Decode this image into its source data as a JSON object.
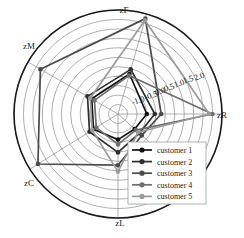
{
  "chart_data": {
    "type": "radar",
    "title": "",
    "xlabel": "",
    "ylabel": "",
    "grid": true,
    "legend_position": "bottom-right-inside",
    "categories": [
      "zR",
      "zF",
      "zM",
      "zC",
      "zL",
      "zX"
    ],
    "visible_axis_labels": [
      "zF",
      "zM",
      "zC",
      "zL",
      "zR"
    ],
    "rlim": [
      -1.25,
      2.0
    ],
    "rticks": [
      -1.0,
      -0.5,
      0.0,
      0.5,
      1.0,
      1.5,
      2.0
    ],
    "rtick_labels": [
      "-1.0",
      "-0.5",
      "0.0",
      "0.5",
      "1.0",
      "1.5",
      "2.0"
    ],
    "rtick_label_angle_deg": 20,
    "n_grid_rings": 11,
    "series": [
      {
        "name": "customer 1",
        "color": "#111111",
        "values": [
          -0.35,
          0.05,
          -0.3,
          -0.35,
          -0.45,
          -0.55
        ]
      },
      {
        "name": "customer 2",
        "color": "#2e2e2e",
        "values": [
          -0.1,
          0.2,
          -0.15,
          -0.2,
          -0.05,
          -0.35
        ]
      },
      {
        "name": "customer 3",
        "color": "#4a4a4a",
        "values": [
          0.1,
          1.85,
          1.55,
          1.7,
          0.35,
          -0.25
        ]
      },
      {
        "name": "customer 4",
        "color": "#6e6e6e",
        "values": [
          1.7,
          0.0,
          -0.4,
          -0.45,
          -0.3,
          -0.5
        ]
      },
      {
        "name": "customer 5",
        "color": "#9a9a9a",
        "values": [
          1.6,
          1.8,
          -0.25,
          -0.3,
          0.55,
          -0.4
        ]
      }
    ]
  },
  "axes": {
    "labels": [
      {
        "id": "zF",
        "text": "zF",
        "x": 124,
        "y": 13
      },
      {
        "id": "zM",
        "text": "zM",
        "x": 29,
        "y": 49
      },
      {
        "id": "zC",
        "text": "zC",
        "x": 29,
        "y": 186
      },
      {
        "id": "zL",
        "text": "zL",
        "x": 120,
        "y": 226
      },
      {
        "id": "zR",
        "text": "zR",
        "x": 222,
        "y": 118
      }
    ]
  },
  "radial_ticks": {
    "labels": [
      {
        "value": "-1.0",
        "x": 139,
        "y": 103
      },
      {
        "value": "-0.5",
        "x": 152,
        "y": 98
      },
      {
        "value": "0.0",
        "x": 161,
        "y": 94
      },
      {
        "value": "0.5",
        "x": 170,
        "y": 90
      },
      {
        "value": "1.0",
        "x": 180,
        "y": 86
      },
      {
        "value": "1.5",
        "x": 189,
        "y": 82
      },
      {
        "value": "2.0",
        "x": 200,
        "y": 79
      }
    ]
  },
  "legend": {
    "entries": [
      {
        "label": "customer 1",
        "color": "#111111"
      },
      {
        "label": "customer 2",
        "color": "#2e2e2e"
      },
      {
        "label": "customer 3",
        "color": "#4a4a4a"
      },
      {
        "label": "customer 4",
        "color": "#6e6e6e"
      },
      {
        "label": "customer 5",
        "color": "#9a9a9a"
      }
    ],
    "box": {
      "x": 128,
      "y": 142,
      "width": 78,
      "height": 62
    },
    "border_color": "#9aa39a",
    "background": "#ffffff"
  },
  "style": {
    "grid_color": "#8c8c8c",
    "outer_circle_color": "#1a1a1a",
    "spoke_color": "#8c8c8c",
    "background": "#ffffff"
  }
}
